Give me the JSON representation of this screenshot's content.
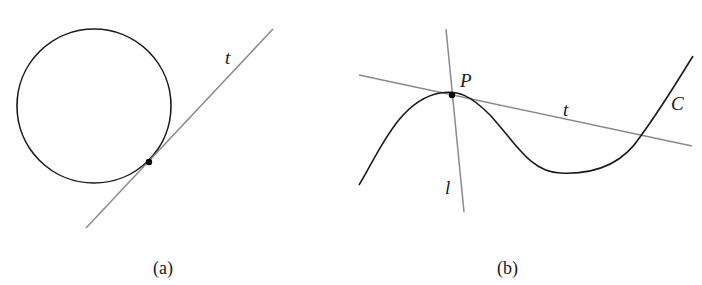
{
  "figure": {
    "panels": [
      {
        "id": "a",
        "caption": "(a)",
        "description": "Circle with tangent line t touching at a single point",
        "labels": {
          "tangent_line": "t"
        },
        "colors": {
          "curve": "#1a1a1a",
          "line": "#8a8a8a",
          "point": "#000000"
        }
      },
      {
        "id": "b",
        "caption": "(b)",
        "description": "Curve C with tangent line t at point P and line l through P",
        "labels": {
          "point": "P",
          "tangent_line": "t",
          "curve": "C",
          "other_line": "l"
        },
        "colors": {
          "curve": "#1a1a1a",
          "line": "#8a8a8a",
          "point": "#000000"
        }
      }
    ]
  }
}
